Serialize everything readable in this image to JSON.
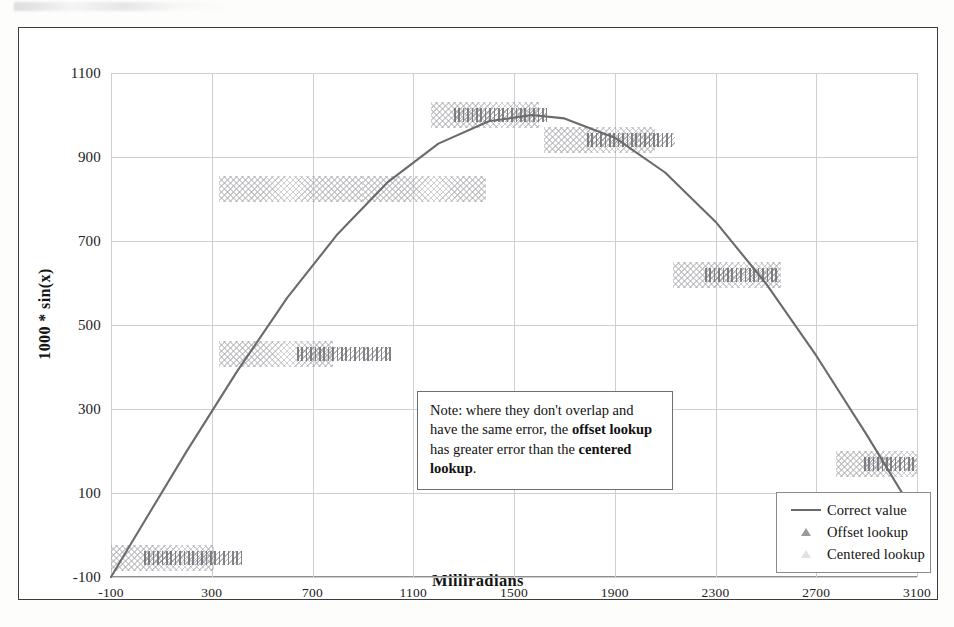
{
  "chart_data": {
    "type": "line",
    "title": "",
    "xlabel": "Milliradians",
    "ylabel": "1000 * sin(x)",
    "xlim": [
      -100,
      3100
    ],
    "ylim": [
      -100,
      1100
    ],
    "xticks": [
      "-100",
      "300",
      "700",
      "1100",
      "1500",
      "1900",
      "2300",
      "2700",
      "3100"
    ],
    "xtick_values": [
      -100,
      300,
      700,
      1100,
      1500,
      1900,
      2300,
      2700,
      3100
    ],
    "yticks": [
      "1100",
      "900",
      "700",
      "500",
      "300",
      "100",
      "-100"
    ],
    "ytick_values": [
      1100,
      900,
      700,
      500,
      300,
      100,
      -100
    ],
    "grid": true,
    "legend_position": "bottom-right",
    "series": [
      {
        "name": "Correct value",
        "style": "line",
        "color": "#6a6a6a",
        "points": [
          {
            "x": -100,
            "y": -100
          },
          {
            "x": 0,
            "y": 0
          },
          {
            "x": 200,
            "y": 199
          },
          {
            "x": 400,
            "y": 389
          },
          {
            "x": 600,
            "y": 565
          },
          {
            "x": 800,
            "y": 717
          },
          {
            "x": 1000,
            "y": 841
          },
          {
            "x": 1200,
            "y": 932
          },
          {
            "x": 1400,
            "y": 985
          },
          {
            "x": 1571,
            "y": 1000
          },
          {
            "x": 1700,
            "y": 992
          },
          {
            "x": 1900,
            "y": 946
          },
          {
            "x": 2100,
            "y": 863
          },
          {
            "x": 2300,
            "y": 746
          },
          {
            "x": 2500,
            "y": 599
          },
          {
            "x": 2700,
            "y": 427
          },
          {
            "x": 2900,
            "y": 239
          },
          {
            "x": 3100,
            "y": 42
          }
        ]
      },
      {
        "name": "Offset lookup",
        "style": "markers",
        "marker": "triangle",
        "color": "#6c6c72",
        "steps": [
          {
            "x_start": 30,
            "x_end": 420,
            "y": -55
          },
          {
            "x_start": 640,
            "x_end": 1010,
            "y": 430
          },
          {
            "x_start": 1260,
            "x_end": 1630,
            "y": 1000
          },
          {
            "x_start": 1790,
            "x_end": 2140,
            "y": 940
          },
          {
            "x_start": 2260,
            "x_end": 2550,
            "y": 620
          },
          {
            "x_start": 2890,
            "x_end": 3100,
            "y": 170
          }
        ]
      },
      {
        "name": "Centered lookup",
        "style": "markers",
        "marker": "triangle",
        "color": "#969698",
        "steps": [
          {
            "x_start": -100,
            "x_end": 310,
            "y": -55
          },
          {
            "x_start": 330,
            "x_end": 780,
            "y": 430
          },
          {
            "x_start": 900,
            "x_end": 1390,
            "y": 825
          },
          {
            "x_start": 1170,
            "x_end": 1600,
            "y": 1000
          },
          {
            "x_start": 1620,
            "x_end": 2060,
            "y": 940
          },
          {
            "x_start": 2130,
            "x_end": 2560,
            "y": 620
          },
          {
            "x_start": 2780,
            "x_end": 3100,
            "y": 170
          }
        ],
        "extra_steps": [
          {
            "x_start": 330,
            "x_end": 900,
            "y": 825
          }
        ]
      }
    ],
    "annotations": [
      {
        "name": "note",
        "text_parts": [
          {
            "text": "Note: where they don't overlap and have the same error, the ",
            "bold": false
          },
          {
            "text": "offset lookup",
            "bold": true
          },
          {
            "text": " has greater error than the ",
            "bold": false
          },
          {
            "text": "centered lookup",
            "bold": true
          },
          {
            "text": ".",
            "bold": false
          }
        ],
        "plain_text": "Note: where they don't overlap and have the same error, the offset lookup has greater error than the centered lookup.",
        "has_arrow": true,
        "arrow_direction": "up-left"
      }
    ]
  },
  "legend": {
    "items": [
      {
        "label": "Correct value",
        "key": "line-key"
      },
      {
        "label": "Offset lookup",
        "key": "triangle-dark-key"
      },
      {
        "label": "Centered lookup",
        "key": "triangle-light-key"
      }
    ]
  },
  "note": {
    "prefix": "Note: where they don't overlap and have the same error, the ",
    "bold1": "offset lookup",
    "middle": " has greater error than the ",
    "bold2": "centered lookup",
    "suffix": "."
  },
  "axes": {
    "x_title": "Milliradians",
    "y_title": "1000 * sin(x)"
  }
}
